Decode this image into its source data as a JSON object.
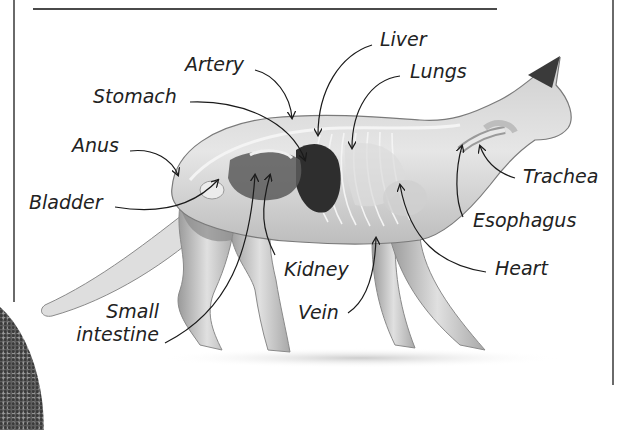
{
  "diagram": {
    "colors": {
      "text": "#222222",
      "frame": "#6a6a6a",
      "body_fill": "#d9d9d9",
      "organ_dark": "#2e2e2e",
      "leader_line": "#1a1a1a"
    },
    "labels": {
      "artery": "Artery",
      "liver": "Liver",
      "lungs": "Lungs",
      "stomach": "Stomach",
      "anus": "Anus",
      "trachea": "Trachea",
      "bladder": "Bladder",
      "esophagus": "Esophagus",
      "kidney": "Kidney",
      "heart": "Heart",
      "small_intestine_line1": "Small",
      "small_intestine_line2": "intestine",
      "vein": "Vein"
    }
  }
}
